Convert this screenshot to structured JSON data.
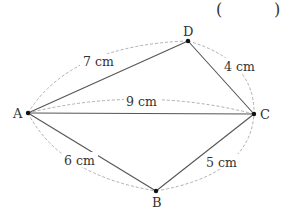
{
  "answer_blank": {
    "open": "(",
    "close": ")"
  },
  "vertices": [
    {
      "id": "A",
      "label": "A",
      "x": 28,
      "y": 113
    },
    {
      "id": "D",
      "label": "D",
      "x": 188,
      "y": 41
    },
    {
      "id": "C",
      "label": "C",
      "x": 254,
      "y": 114
    },
    {
      "id": "B",
      "label": "B",
      "x": 156,
      "y": 191
    }
  ],
  "edges": [
    {
      "from": "A",
      "to": "D",
      "length": "7 cm"
    },
    {
      "from": "D",
      "to": "C",
      "length": "4 cm"
    },
    {
      "from": "A",
      "to": "C",
      "length": "9 cm"
    },
    {
      "from": "A",
      "to": "B",
      "length": "6 cm"
    },
    {
      "from": "B",
      "to": "C",
      "length": "5 cm"
    }
  ],
  "colors": {
    "line": "#555555",
    "dashed": "#999999",
    "text": "#333333",
    "point": "#111111"
  }
}
